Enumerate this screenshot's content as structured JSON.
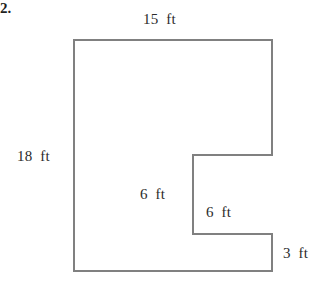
{
  "figure": {
    "problem_number": "2.",
    "shape_name": "l-shaped-polygon-with-notch",
    "stroke_color": "#808080",
    "text_color": "#2b2b2b",
    "background_color": "#ffffff",
    "stroke_width": 2,
    "unit": "ft",
    "outline_points": "74,40 272,40 272,155 193,155 193,234 272,234 272,271 74,271",
    "vertices": [
      {
        "name": "top-left",
        "x": 74,
        "y": 40
      },
      {
        "name": "top-right",
        "x": 272,
        "y": 40
      },
      {
        "name": "notch-top-right",
        "x": 272,
        "y": 155
      },
      {
        "name": "notch-top-left",
        "x": 193,
        "y": 155
      },
      {
        "name": "notch-bottom-left",
        "x": 193,
        "y": 234
      },
      {
        "name": "notch-bottom-right",
        "x": 272,
        "y": 234
      },
      {
        "name": "bottom-right",
        "x": 272,
        "y": 271
      },
      {
        "name": "bottom-left",
        "x": 74,
        "y": 271
      }
    ],
    "labels": {
      "top": "15  ft",
      "left": "18  ft",
      "inner_vertical": "6  ft",
      "inner_horizontal": "6  ft",
      "lower_right_step": "3  ft"
    }
  }
}
